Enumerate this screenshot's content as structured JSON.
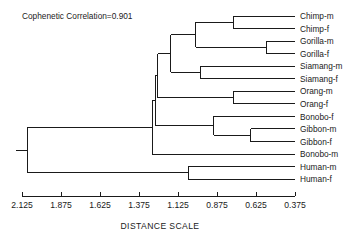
{
  "chart_data": {
    "type": "dendrogram",
    "title": "",
    "annotation": "Cophenetic Correlation=0.901",
    "xlabel": "DISTANCE SCALE",
    "ylabel": "",
    "axis": {
      "orientation": "horizontal-reversed",
      "ticks": [
        "2.125",
        "1.875",
        "1.625",
        "1.375",
        "1.125",
        "0.875",
        "0.625",
        "0.375"
      ],
      "tick_values": [
        2.125,
        1.875,
        1.625,
        1.375,
        1.125,
        0.875,
        0.625,
        0.375
      ],
      "xlim": [
        2.125,
        0.375
      ],
      "grid": false,
      "legend": "none"
    },
    "leaves": [
      "Chimp-m",
      "Chimp-f",
      "Gorilla-m",
      "Gorilla-f",
      "Siamang-m",
      "Siamang-f",
      "Orang-m",
      "Orang-f",
      "Bonobo-f",
      "Gibbon-m",
      "Gibbon-f",
      "Bonobo-m",
      "Human-m",
      "Human-f"
    ],
    "merges": [
      {
        "id": "n1",
        "left": "Chimp-m",
        "right": "Chimp-f",
        "distance": 0.77
      },
      {
        "id": "n2",
        "left": "Gorilla-m",
        "right": "Gorilla-f",
        "distance": 0.56
      },
      {
        "id": "n3",
        "left": "n1",
        "right": "n2",
        "distance": 1.01
      },
      {
        "id": "n4",
        "left": "Siamang-m",
        "right": "Siamang-f",
        "distance": 0.98
      },
      {
        "id": "n5",
        "left": "n3",
        "right": "n4",
        "distance": 1.17
      },
      {
        "id": "n6",
        "left": "Orang-m",
        "right": "Orang-f",
        "distance": 0.77
      },
      {
        "id": "n7",
        "left": "n5",
        "right": "n6",
        "distance": 1.255
      },
      {
        "id": "n8",
        "left": "Gibbon-m",
        "right": "Gibbon-f",
        "distance": 0.66
      },
      {
        "id": "n9",
        "left": "Bonobo-f",
        "right": "n8",
        "distance": 0.895
      },
      {
        "id": "n10",
        "left": "n9",
        "right": "n7",
        "distance": 1.27
      },
      {
        "id": "n11",
        "left": "n10",
        "right": "Bonobo-m",
        "distance": 1.29
      },
      {
        "id": "n12",
        "left": "Human-m",
        "right": "Human-f",
        "distance": 1.06
      },
      {
        "id": "n13",
        "left": "n11",
        "right": "n12",
        "distance": 2.09
      }
    ],
    "colors": {
      "line": "#1a1a1a",
      "text": "#1a1a1a",
      "background": "#ffffff"
    }
  }
}
